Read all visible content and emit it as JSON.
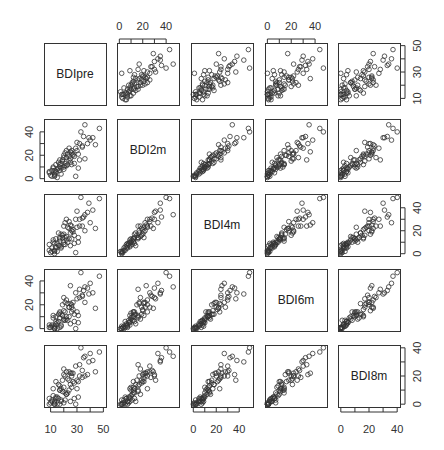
{
  "chart_data": {
    "type": "scatter",
    "subtype": "scatterplot-matrix",
    "title": "",
    "variables": [
      "BDIpre",
      "BDI2m",
      "BDI4m",
      "BDI6m",
      "BDI8m"
    ],
    "axes": {
      "BDIpre": {
        "range": [
          5,
          52
        ],
        "ticks": [
          10,
          20,
          30,
          40,
          50
        ],
        "labels": [
          10,
          30,
          50
        ],
        "label_side": "bottom",
        "label_side_y": "right"
      },
      "BDI2m": {
        "range": [
          -2,
          51
        ],
        "ticks": [
          0,
          10,
          20,
          30,
          40
        ],
        "labels": [
          0,
          20,
          40
        ],
        "label_side": "top",
        "label_side_y": "left"
      },
      "BDI4m": {
        "range": [
          -2,
          52
        ],
        "ticks": [
          0,
          10,
          20,
          30,
          40
        ],
        "labels": [
          0,
          20,
          40
        ],
        "label_side": "bottom",
        "label_side_y": "right"
      },
      "BDI6m": {
        "range": [
          -2,
          50
        ],
        "ticks": [
          0,
          10,
          20,
          30,
          40
        ],
        "labels": [
          0,
          20,
          40
        ],
        "label_side": "top",
        "label_side_y": "left"
      },
      "BDI8m": {
        "range": [
          -2,
          42
        ],
        "ticks": [
          0,
          10,
          20,
          30,
          40
        ],
        "labels": [
          0,
          20,
          40
        ],
        "label_side": "bottom",
        "label_side_y": "right"
      }
    },
    "layout": {
      "panel_x": [
        44,
        117,
        191,
        265,
        338
      ],
      "panel_y": [
        43,
        119,
        194,
        269,
        345
      ],
      "panel_size": 62,
      "grid": false,
      "marker": "open-circle"
    },
    "observations": [
      [
        29,
        2,
        1,
        0,
        0
      ],
      [
        32,
        16,
        24,
        33,
        28
      ],
      [
        25,
        23,
        25,
        36,
        22
      ],
      [
        21,
        11,
        8,
        7,
        3
      ],
      [
        26,
        24,
        24,
        20,
        20
      ],
      [
        17,
        16,
        14,
        9,
        13
      ],
      [
        20,
        8,
        8,
        7,
        1
      ],
      [
        13,
        7,
        9,
        2,
        2
      ],
      [
        17,
        7,
        7,
        1,
        0
      ],
      [
        15,
        1,
        2,
        0,
        0
      ],
      [
        18,
        13,
        17,
        12,
        11
      ],
      [
        32,
        30,
        30,
        26,
        20
      ],
      [
        24,
        16,
        13,
        10,
        10
      ],
      [
        20,
        10,
        10,
        8,
        12
      ],
      [
        22,
        24,
        30,
        24,
        23
      ],
      [
        13,
        4,
        3,
        0,
        1
      ],
      [
        31,
        9,
        10,
        5,
        5
      ],
      [
        13,
        3,
        2,
        1,
        0
      ],
      [
        17,
        12,
        11,
        14,
        10
      ],
      [
        14,
        6,
        5,
        4,
        4
      ],
      [
        28,
        19,
        16,
        12,
        15
      ],
      [
        23,
        21,
        23,
        21,
        18
      ],
      [
        29,
        26,
        30,
        30,
        27
      ],
      [
        16,
        9,
        7,
        6,
        4
      ],
      [
        34,
        28,
        31,
        27,
        24
      ],
      [
        42,
        35,
        38,
        30,
        31
      ],
      [
        9,
        5,
        3,
        1,
        0
      ],
      [
        12,
        10,
        10,
        9,
        6
      ],
      [
        19,
        16,
        14,
        11,
        9
      ],
      [
        38,
        30,
        36,
        34,
        21
      ],
      [
        33,
        40,
        49,
        47,
        40
      ],
      [
        47,
        43,
        48,
        44,
        37
      ],
      [
        36,
        46,
        34,
        35,
        34
      ],
      [
        25,
        17,
        18,
        21,
        14
      ],
      [
        30,
        24,
        23,
        14,
        11
      ],
      [
        11,
        2,
        2,
        2,
        3
      ],
      [
        21,
        13,
        14,
        14,
        8
      ],
      [
        27,
        20,
        21,
        16,
        16
      ],
      [
        24,
        19,
        22,
        18,
        17
      ],
      [
        10,
        3,
        1,
        1,
        1
      ],
      [
        20,
        20,
        17,
        15,
        21
      ],
      [
        36,
        17,
        20,
        22,
        20
      ],
      [
        22,
        11,
        12,
        10,
        7
      ],
      [
        15,
        8,
        9,
        5,
        5
      ],
      [
        27,
        21,
        19,
        22,
        22
      ],
      [
        18,
        9,
        6,
        3,
        2
      ],
      [
        34,
        27,
        24,
        28,
        19
      ],
      [
        14,
        12,
        13,
        10,
        16
      ],
      [
        12,
        9,
        12,
        11,
        11
      ],
      [
        26,
        22,
        20,
        18,
        22
      ],
      [
        39,
        35,
        44,
        29,
        30
      ],
      [
        22,
        18,
        15,
        8,
        7
      ],
      [
        16,
        14,
        18,
        12,
        14
      ],
      [
        30,
        31,
        37,
        25,
        17
      ],
      [
        24,
        26,
        28,
        18,
        23
      ],
      [
        19,
        15,
        16,
        20,
        17
      ],
      [
        28,
        13,
        9,
        6,
        4
      ],
      [
        11,
        7,
        5,
        3,
        2
      ],
      [
        35,
        36,
        32,
        32,
        33
      ],
      [
        20,
        18,
        24,
        26,
        25
      ],
      [
        13,
        2,
        0,
        0,
        0
      ],
      [
        23,
        12,
        10,
        7,
        8
      ],
      [
        40,
        33,
        27,
        38,
        36
      ],
      [
        25,
        14,
        7,
        4,
        2
      ],
      [
        17,
        10,
        13,
        13,
        10
      ],
      [
        21,
        22,
        27,
        22,
        20
      ],
      [
        31,
        21,
        14,
        11,
        16
      ],
      [
        9,
        6,
        8,
        3,
        4
      ],
      [
        44,
        29,
        22,
        17,
        23
      ],
      [
        18,
        4,
        5,
        2,
        3
      ],
      [
        26,
        12,
        13,
        14,
        12
      ],
      [
        14,
        5,
        6,
        6,
        5
      ]
    ]
  }
}
